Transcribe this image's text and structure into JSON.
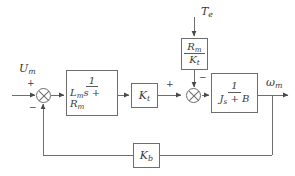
{
  "diagram": {
    "type": "control-block-diagram",
    "line_color": "#6e6e6e",
    "text_color": "#3a3a3a",
    "background": "#ffffff"
  },
  "signals": {
    "input_label": "U",
    "input_sub": "m",
    "disturbance_label": "T",
    "disturbance_sub": "e",
    "output_label": "ω",
    "output_sub": "m"
  },
  "blocks": {
    "electrical": {
      "name": "electrical-dynamics-block",
      "numerator": "1",
      "denominator_base1": "L",
      "denominator_sub1": "m",
      "denominator_mid": "s + ",
      "denominator_base2": "R",
      "denominator_sub2": "m",
      "expression": "1/(L_m s + R_m)"
    },
    "torque_constant": {
      "name": "torque-constant-gain",
      "base": "K",
      "sub": "t",
      "expression": "K_t"
    },
    "disturbance_gain": {
      "name": "disturbance-gain-block",
      "num_base": "R",
      "num_sub": "m",
      "den_base": "K",
      "den_sub": "t",
      "expression": "R_m/K_t"
    },
    "mechanical": {
      "name": "mechanical-dynamics-block",
      "numerator": "1",
      "denominator_base1": "J",
      "denominator_sub1": "s",
      "denominator_rest": " + B",
      "expression": "1/(J_s + B)"
    },
    "back_emf": {
      "name": "back-emf-gain",
      "base": "K",
      "sub": "b",
      "expression": "K_b"
    }
  },
  "summing_junctions": {
    "input_junction": {
      "name": "input-summing-junction",
      "sign_top": "+",
      "sign_bottom": "−"
    },
    "torque_junction": {
      "name": "torque-summing-junction",
      "sign_left": "+",
      "sign_top": "−"
    }
  }
}
